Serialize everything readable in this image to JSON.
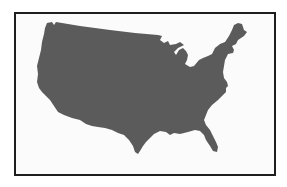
{
  "map": {
    "title": "United States",
    "region": "contiguous-united-states",
    "style": "silhouette",
    "colors": {
      "fill": "#5b5b5b",
      "border": "#1e1e1e",
      "background": "#fbfbfb"
    }
  }
}
